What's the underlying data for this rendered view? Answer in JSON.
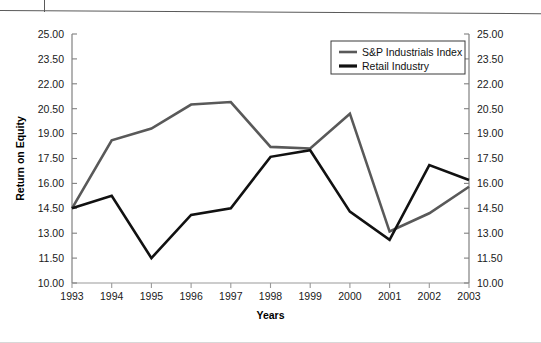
{
  "chart_data": {
    "type": "line",
    "title": "",
    "xlabel": "Years",
    "ylabel": "Return on Equity",
    "categories": [
      "1993",
      "1994",
      "1995",
      "1996",
      "1997",
      "1998",
      "1999",
      "2000",
      "2001",
      "2002",
      "2003"
    ],
    "x": [
      1993,
      1994,
      1995,
      1996,
      1997,
      1998,
      1999,
      2000,
      2001,
      2002,
      2003
    ],
    "ylim": [
      10.0,
      25.0
    ],
    "ytick_labels": [
      "25.00",
      "23.50",
      "22.00",
      "20.50",
      "19.00",
      "17.50",
      "16.00",
      "14.50",
      "13.00",
      "11.50",
      "10.00"
    ],
    "ytick_values": [
      25.0,
      23.5,
      22.0,
      20.5,
      19.0,
      17.5,
      16.0,
      14.5,
      13.0,
      11.5,
      10.0
    ],
    "y_axis_right_labels": [
      "25.00",
      "23.50",
      "22.00",
      "20.50",
      "19.00",
      "17.50",
      "16.00",
      "14.50",
      "13.00",
      "11.50",
      "10.00"
    ],
    "grid": false,
    "legend_position": "top-right",
    "series": [
      {
        "name": "S&P Industrials Index",
        "color": "#595959",
        "values": [
          14.5,
          18.6,
          19.3,
          20.75,
          20.9,
          18.2,
          18.1,
          20.2,
          13.1,
          14.2,
          15.8
        ]
      },
      {
        "name": "Retail Industry",
        "color": "#111111",
        "values": [
          14.5,
          15.25,
          11.5,
          14.1,
          14.5,
          17.6,
          18.0,
          14.3,
          12.6,
          17.1,
          16.2
        ]
      }
    ]
  },
  "legend": {
    "items": [
      {
        "label": "S&P Industrials Index",
        "color": "#595959"
      },
      {
        "label": "Retail Industry",
        "color": "#111111"
      }
    ]
  },
  "axes": {
    "y_title": "Return on Equity",
    "x_title": "Years"
  }
}
